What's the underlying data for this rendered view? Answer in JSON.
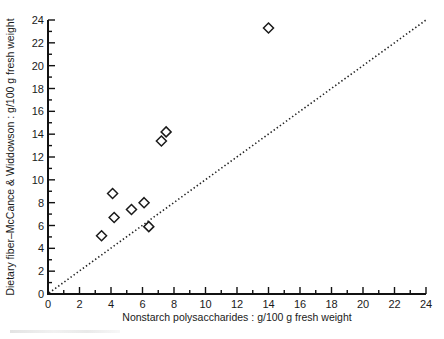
{
  "chart_data": {
    "type": "scatter",
    "title": "",
    "xlabel": "Nonstarch polysaccharides : g/100 g fresh weight",
    "ylabel": "Dietary fiber–McCance & Widdowson : g/100 g fresh weight",
    "xlim": [
      0,
      24
    ],
    "ylim": [
      0,
      24
    ],
    "xticks": [
      0,
      2,
      4,
      6,
      8,
      10,
      12,
      14,
      16,
      18,
      20,
      22,
      24
    ],
    "yticks": [
      0,
      2,
      4,
      6,
      8,
      10,
      12,
      14,
      16,
      18,
      20,
      22,
      24
    ],
    "minor_tick_step": 1,
    "grid": false,
    "legend": null,
    "marker": "open-diamond",
    "series": [
      {
        "name": "Foods",
        "points": [
          {
            "x": 3.4,
            "y": 5.1
          },
          {
            "x": 4.1,
            "y": 8.8
          },
          {
            "x": 4.2,
            "y": 6.7
          },
          {
            "x": 5.3,
            "y": 7.4
          },
          {
            "x": 6.1,
            "y": 8.0
          },
          {
            "x": 6.4,
            "y": 5.9
          },
          {
            "x": 7.2,
            "y": 13.4
          },
          {
            "x": 7.5,
            "y": 14.2
          },
          {
            "x": 14.0,
            "y": 23.3
          }
        ]
      }
    ],
    "reference_line": {
      "type": "identity",
      "label": "y = x",
      "style": "dotted",
      "from": [
        0,
        0
      ],
      "to": [
        24,
        24
      ]
    }
  },
  "plot_area": {
    "x0_px": 48,
    "x1_px": 426,
    "y0_px": 294,
    "y1_px": 20
  }
}
